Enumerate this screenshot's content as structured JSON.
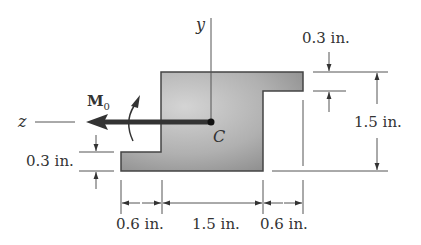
{
  "diagram": {
    "type": "beam cross-section with applied moment",
    "colors": {
      "section_fill_light": "#c8c8c8",
      "section_fill_dark": "#8a8a8a",
      "outline": "#444444",
      "arrow": "#333333",
      "text": "#333333"
    },
    "axes": {
      "y_label": "y",
      "z_label": "z"
    },
    "centroid_label": "C",
    "moment": {
      "symbol": "M",
      "subscript": "0"
    },
    "dimensions": {
      "top_flange_thickness": "0.3 in.",
      "overall_height": "1.5 in.",
      "bottom_flange_thickness": "0.3 in.",
      "bottom_left_overhang": "0.6 in.",
      "web_width": "1.5 in.",
      "top_right_overhang": "0.6 in."
    }
  }
}
